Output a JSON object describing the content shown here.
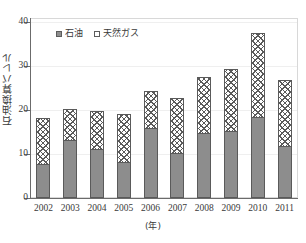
{
  "chart_data": {
    "type": "bar",
    "subtype": "stacked-bar",
    "title": "",
    "xlabel": "(年)",
    "ylabel": "石油換算バレル",
    "categories": [
      "2002",
      "2003",
      "2004",
      "2005",
      "2006",
      "2007",
      "2008",
      "2009",
      "2010",
      "2011"
    ],
    "series": [
      {
        "name": "石油",
        "color": "#8d8d8d",
        "pattern": "solid-gray",
        "values": [
          7.5,
          13,
          11,
          8,
          15.5,
          10,
          14.5,
          15,
          18,
          11.5
        ]
      },
      {
        "name": "天然ガス",
        "color": "#ffffff",
        "pattern": "cross-hatch",
        "values": [
          10.5,
          7,
          8.5,
          11,
          8.5,
          12.5,
          12.5,
          14,
          19,
          15
        ]
      }
    ],
    "totals": [
      18,
      20,
      19.5,
      19,
      24,
      22.5,
      27,
      29,
      37,
      26.5
    ],
    "ylim": [
      0,
      40
    ],
    "yticks": [
      0,
      10,
      20,
      30,
      40
    ],
    "ytick_labels": [
      "0",
      "10",
      "20",
      "30",
      "40"
    ],
    "grid": true,
    "legend_position": "top-left-inside"
  },
  "axes": {
    "y_tick_labels": [
      "40",
      "30",
      "20",
      "10",
      "0"
    ],
    "y_title": "石油換算バレル",
    "x_title": "(年)",
    "x_tick_labels": [
      "2002",
      "2003",
      "2004",
      "2005",
      "2006",
      "2007",
      "2008",
      "2009",
      "2010",
      "2011"
    ]
  },
  "legend": {
    "items": [
      {
        "label": "石油"
      },
      {
        "label": "天然ガス"
      }
    ]
  }
}
